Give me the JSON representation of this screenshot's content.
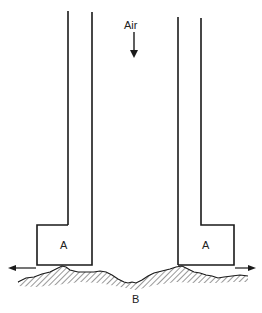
{
  "diagram": {
    "flow_label": "Air",
    "block_left_label": "A",
    "block_right_label": "A",
    "surface_label": "B",
    "stroke_color": "#1a1a1a",
    "background": "#ffffff"
  }
}
